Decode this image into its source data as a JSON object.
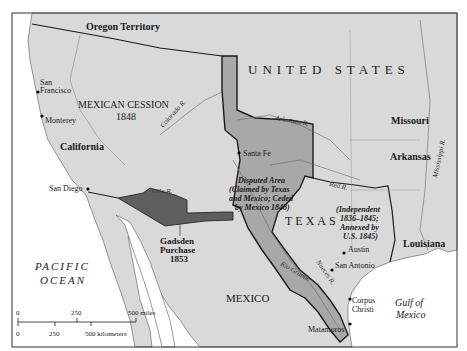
{
  "map": {
    "title_regions": {
      "oregon": "Oregon Territory",
      "us": "UNITED STATES",
      "cession_1": "MEXICAN CESSION",
      "cession_2": "1848",
      "california": "California",
      "missouri": "Missouri",
      "arkansas": "Arkansas",
      "louisiana": "Louisiana",
      "texas": "TEXAS",
      "mexico": "MEXICO",
      "gadsden_1": "Gadsden",
      "gadsden_2": "Purchase",
      "gadsden_3": "1853"
    },
    "annotations": {
      "disputed": [
        "Disputed Area",
        "(Claimed by Texas",
        "and Mexico; Ceded",
        "by Mexico 1848)"
      ],
      "texas_note": [
        "(Independent",
        "1836–1845;",
        "Annexed by",
        "U.S. 1845)"
      ]
    },
    "cities": [
      {
        "name": "San",
        "name2": "Francisco"
      },
      {
        "name": "Monterey"
      },
      {
        "name": "San Diego"
      },
      {
        "name": "Santa Fe"
      },
      {
        "name": "Austin"
      },
      {
        "name": "San Antonio"
      },
      {
        "name": "Corpus",
        "name2": "Christi"
      },
      {
        "name": "Matamoros"
      }
    ],
    "rivers": {
      "colorado": "Colorado R.",
      "arkansas": "Arkansas R.",
      "red": "Red R.",
      "gila": "Gila R.",
      "rio_grande": "Rio Grande",
      "nueces": "Nueces R.",
      "mississippi": "Mississippi R."
    },
    "water": {
      "pacific_1": "PACIFIC",
      "pacific_2": "OCEAN",
      "gulf_1": "Gulf of",
      "gulf_2": "Mexico"
    },
    "scale": {
      "miles_ticks": [
        "0",
        "250",
        "500 miles"
      ],
      "km_ticks": [
        "0",
        "250",
        "500 kilometers"
      ]
    },
    "colors": {
      "land": "#d9d9d9",
      "disputed": "#a8a8a8",
      "gadsden": "#5e5e5e",
      "water": "#ffffff",
      "border": "#1a1a1a"
    }
  }
}
